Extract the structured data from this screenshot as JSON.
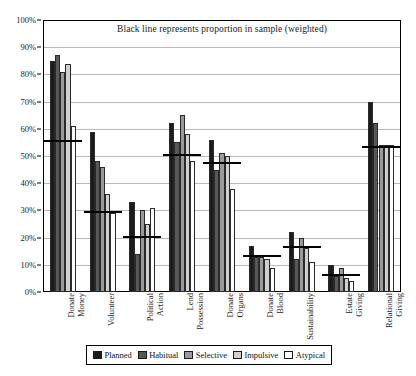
{
  "chart_data": {
    "type": "bar",
    "title": "Black line represents proportion in sample (weighted)",
    "xlabel": "",
    "ylabel": "",
    "ylim": [
      0,
      100
    ],
    "ytick_labels": [
      "0%",
      "10%",
      "20%",
      "30%",
      "40%",
      "50%",
      "60%",
      "70%",
      "80%",
      "90%",
      "100%"
    ],
    "ytick_values": [
      0,
      10,
      20,
      30,
      40,
      50,
      60,
      70,
      80,
      90,
      100
    ],
    "grid": true,
    "legend_position": "bottom",
    "categories": [
      "Donate Money",
      "Volunteer",
      "Political Action",
      "Lend Possession",
      "Donate Organs",
      "Donate Blood",
      "Sustainability",
      "Estate Giving",
      "Relational Giving"
    ],
    "series": [
      {
        "name": "Planned",
        "color": "#1c1c1c",
        "values": [
          85,
          59,
          33,
          62,
          56,
          17,
          22,
          10,
          70
        ]
      },
      {
        "name": "Habitual",
        "color": "#585858",
        "values": [
          87,
          48,
          14,
          55,
          45,
          13,
          12,
          6,
          62
        ]
      },
      {
        "name": "Selective",
        "color": "#9a9a9a",
        "values": [
          81,
          46,
          30,
          65,
          51,
          13,
          20,
          9,
          54
        ]
      },
      {
        "name": "Impulsive",
        "color": "#cfcfcf",
        "values": [
          84,
          36,
          25,
          58,
          50,
          12,
          16,
          5,
          54
        ]
      },
      {
        "name": "Atypical",
        "color": "#ffffff",
        "values": [
          61,
          29,
          31,
          48,
          38,
          9,
          11,
          4,
          54
        ]
      }
    ],
    "reference_lines": {
      "label": "proportion in sample (weighted)",
      "color": "#000000",
      "values": [
        55,
        29,
        20,
        50,
        47,
        13,
        16,
        6,
        53
      ]
    }
  },
  "legend": {
    "items": [
      {
        "label": "Planned",
        "swatch": "#1c1c1c"
      },
      {
        "label": "Habitual",
        "swatch": "#585858"
      },
      {
        "label": "Selective",
        "swatch": "#9a9a9a"
      },
      {
        "label": "Impulsive",
        "swatch": "#cfcfcf"
      },
      {
        "label": "Atypical",
        "swatch": "#ffffff"
      }
    ]
  }
}
